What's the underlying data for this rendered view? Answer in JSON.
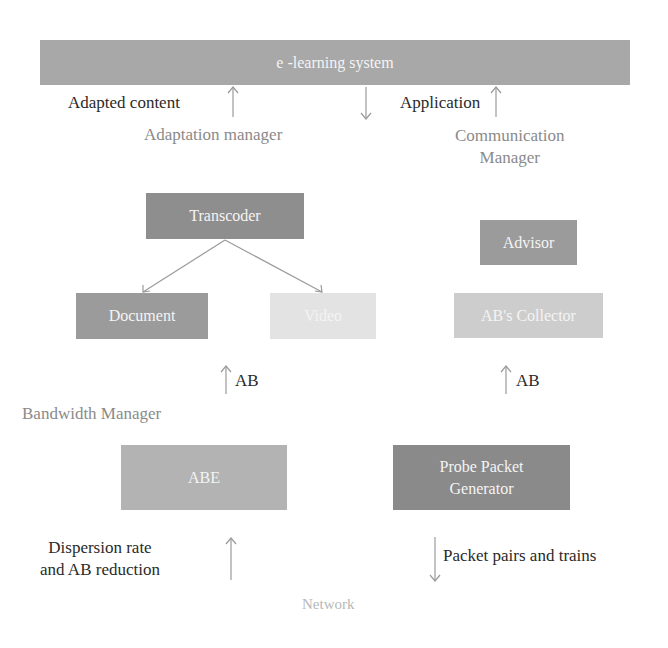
{
  "diagram": {
    "colors": {
      "top_bar": "#a8a8a8",
      "box_dark": "#8e8e8e",
      "box_medium": "#a5a5a5",
      "box_light": "#c4c4c4",
      "box_very_light": "#e3e3e3",
      "arrow": "#9a9a9a"
    },
    "top_bar": {
      "label": "e -learning system"
    },
    "labels": {
      "adapted_content": "Adapted content",
      "application": "Application",
      "adaptation_manager": "Adaptation manager",
      "communication_manager_line1": "Communication",
      "communication_manager_line2": "Manager",
      "ab_left": "AB",
      "ab_right": "AB",
      "bandwidth_manager": "Bandwidth Manager",
      "dispersion_line1": "Dispersion rate",
      "dispersion_line2": "and AB reduction",
      "packet_pairs": "Packet pairs and trains",
      "network": "Network"
    },
    "boxes": {
      "transcoder": "Transcoder",
      "document": "Document",
      "video": "Video",
      "advisor": "Advisor",
      "collector": "AB's Collector",
      "abe": "ABE",
      "probe_line1": "Probe Packet",
      "probe_line2": "Generator"
    }
  }
}
